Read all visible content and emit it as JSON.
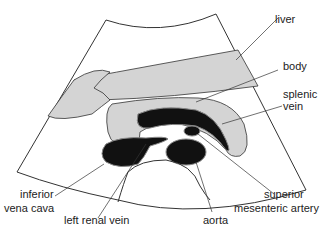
{
  "diagram": {
    "type": "ultrasound-transverse-section",
    "labels": {
      "liver": "liver",
      "body": "body",
      "splenic_vein_1": "splenic",
      "splenic_vein_2": "vein",
      "ivc_1": "inferior",
      "ivc_2": "vena cava",
      "left_renal_vein": "left renal vein",
      "aorta": "aorta",
      "sma_1": "superior",
      "sma_2": "mesenteric artery"
    },
    "colors": {
      "tissue_gray": "#d4d4d4",
      "vessel_black": "#111111",
      "outline": "#333333"
    }
  }
}
